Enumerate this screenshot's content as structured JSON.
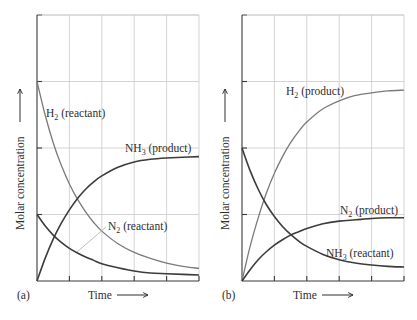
{
  "figure": {
    "panels": [
      {
        "id": "a",
        "panel_label": "(a)",
        "xlabel": "Time",
        "ylabel": "Molar concentration",
        "series_labels": [
          {
            "main": "H",
            "sub": "2",
            "rest": " (reactant)"
          },
          {
            "main": "NH",
            "sub": "3",
            "rest": " (product)"
          },
          {
            "main": "N",
            "sub": "2",
            "rest": " (reactant)"
          }
        ]
      },
      {
        "id": "b",
        "panel_label": "(b)",
        "xlabel": "Time",
        "ylabel": "Molar concentration",
        "series_labels": [
          {
            "main": "H",
            "sub": "2",
            "rest": " (product)"
          },
          {
            "main": "N",
            "sub": "2",
            "rest": " (product)"
          },
          {
            "main": "NH",
            "sub": "3",
            "rest": " (reactant)"
          }
        ]
      }
    ],
    "colors": {
      "dark_curve": "#3c3c3c",
      "light_curve": "#7a7a7a",
      "grid": "#c9c9c9",
      "axis": "#3a3a3a"
    }
  },
  "chart_data": [
    {
      "type": "line",
      "title": "(a)",
      "xlabel": "Time",
      "ylabel": "Molar concentration",
      "xlim": [
        0,
        5
      ],
      "ylim": [
        0,
        4
      ],
      "grid": true,
      "x": [
        0,
        0.25,
        0.5,
        0.75,
        1,
        1.25,
        1.5,
        1.75,
        2,
        2.5,
        3,
        3.5,
        4,
        4.5,
        5
      ],
      "series": [
        {
          "name": "H2 (reactant)",
          "color": "#7a7a7a",
          "values": [
            3.0,
            2.5,
            2.08,
            1.74,
            1.46,
            1.23,
            1.04,
            0.88,
            0.75,
            0.56,
            0.43,
            0.34,
            0.27,
            0.22,
            0.19
          ]
        },
        {
          "name": "NH3 (product)",
          "color": "#3c3c3c",
          "values": [
            0.0,
            0.34,
            0.63,
            0.87,
            1.07,
            1.24,
            1.38,
            1.49,
            1.58,
            1.71,
            1.79,
            1.83,
            1.85,
            1.86,
            1.87
          ]
        },
        {
          "name": "N2 (reactant)",
          "color": "#3c3c3c",
          "values": [
            1.0,
            0.83,
            0.69,
            0.58,
            0.49,
            0.42,
            0.36,
            0.31,
            0.26,
            0.2,
            0.15,
            0.12,
            0.11,
            0.1,
            0.09
          ]
        }
      ]
    },
    {
      "type": "line",
      "title": "(b)",
      "xlabel": "Time",
      "ylabel": "Molar concentration",
      "xlim": [
        0,
        5
      ],
      "ylim": [
        0,
        4
      ],
      "grid": true,
      "x": [
        0,
        0.25,
        0.5,
        0.75,
        1,
        1.25,
        1.5,
        1.75,
        2,
        2.5,
        3,
        3.5,
        4,
        4.5,
        5
      ],
      "series": [
        {
          "name": "H2 (product)",
          "color": "#7a7a7a",
          "values": [
            0.0,
            0.52,
            0.95,
            1.32,
            1.62,
            1.87,
            2.08,
            2.25,
            2.39,
            2.59,
            2.71,
            2.79,
            2.83,
            2.86,
            2.87
          ]
        },
        {
          "name": "N2 (product)",
          "color": "#3c3c3c",
          "values": [
            0.0,
            0.17,
            0.32,
            0.44,
            0.54,
            0.62,
            0.69,
            0.74,
            0.79,
            0.86,
            0.9,
            0.92,
            0.94,
            0.95,
            0.95
          ]
        },
        {
          "name": "NH3 (reactant)",
          "color": "#3c3c3c",
          "values": [
            2.0,
            1.66,
            1.38,
            1.15,
            0.97,
            0.82,
            0.7,
            0.6,
            0.52,
            0.4,
            0.32,
            0.27,
            0.24,
            0.22,
            0.21
          ]
        }
      ]
    }
  ]
}
